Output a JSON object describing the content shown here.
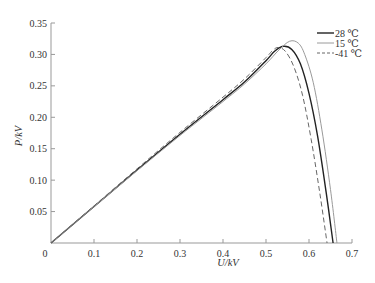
{
  "chart_data": {
    "type": "line",
    "title": "",
    "xlabel": "U/kV",
    "ylabel": "P/kV",
    "xlim": [
      0,
      0.7
    ],
    "ylim": [
      0,
      0.35
    ],
    "xticks": [
      0,
      0.1,
      0.2,
      0.3,
      0.4,
      0.5,
      0.6,
      0.7
    ],
    "xtick_labels": [
      "0",
      "0.1",
      "0.2",
      "0.3",
      "0.4",
      "0.5",
      "0.6",
      "0.7"
    ],
    "yticks": [
      0,
      0.05,
      0.1,
      0.15,
      0.2,
      0.25,
      0.3,
      0.35
    ],
    "ytick_labels": [
      "0",
      "0.05",
      "0.10",
      "0.15",
      "0.20",
      "0.25",
      "0.30",
      "0.35"
    ],
    "grid": false,
    "legend_position": "upper right",
    "series": [
      {
        "name": "28 ℃",
        "style": "solid",
        "color": "#222222",
        "width": 1.4,
        "x": [
          0,
          0.1,
          0.2,
          0.3,
          0.4,
          0.45,
          0.5,
          0.52,
          0.54,
          0.56,
          0.58,
          0.6,
          0.62,
          0.64,
          0.656
        ],
        "y": [
          0,
          0.058,
          0.116,
          0.173,
          0.228,
          0.256,
          0.29,
          0.305,
          0.313,
          0.308,
          0.285,
          0.238,
          0.17,
          0.08,
          0
        ]
      },
      {
        "name": "15 ℃",
        "style": "solid",
        "color": "#9a9a9a",
        "width": 1.0,
        "x": [
          0,
          0.1,
          0.2,
          0.3,
          0.4,
          0.45,
          0.5,
          0.53,
          0.555,
          0.575,
          0.59,
          0.61,
          0.63,
          0.65,
          0.665
        ],
        "y": [
          0,
          0.058,
          0.115,
          0.171,
          0.225,
          0.253,
          0.285,
          0.307,
          0.321,
          0.318,
          0.3,
          0.255,
          0.18,
          0.085,
          0
        ]
      },
      {
        "name": "-41 ℃",
        "style": "dashed",
        "color": "#666666",
        "width": 1.0,
        "x": [
          0,
          0.1,
          0.2,
          0.3,
          0.4,
          0.45,
          0.5,
          0.515,
          0.528,
          0.545,
          0.565,
          0.585,
          0.605,
          0.625,
          0.642
        ],
        "y": [
          0,
          0.059,
          0.118,
          0.176,
          0.232,
          0.261,
          0.295,
          0.306,
          0.311,
          0.305,
          0.28,
          0.235,
          0.165,
          0.08,
          0
        ]
      }
    ]
  }
}
